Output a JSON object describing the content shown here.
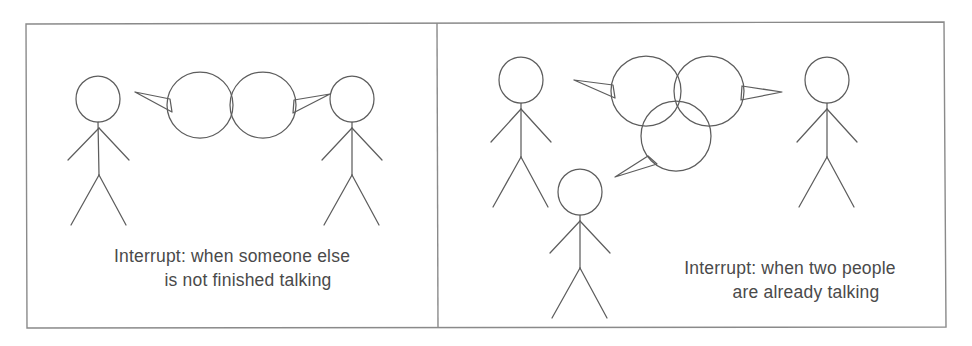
{
  "figure": {
    "type": "line-drawing",
    "medium": "scanned hand-drawn illustration",
    "panel_count": 2,
    "background_color": "#ffffff",
    "ink_color": "#5a5a5a",
    "caption_color": "#4a4a4a"
  },
  "frame": {
    "outer_border": {
      "x": 25,
      "y": 22,
      "width": 921,
      "height": 306
    },
    "divider_x": 437
  },
  "panels": [
    {
      "id": "panel-left",
      "name": "interrupt-one-speaker",
      "caption": {
        "line1": "Interrupt: when someone else",
        "line2": "is not finished talking"
      },
      "people": [
        {
          "name": "speaker-left",
          "head_cx": 98,
          "head_cy": 99,
          "head_r": 22,
          "facing": "right"
        },
        {
          "name": "speaker-right",
          "head_cx": 352,
          "head_cy": 99,
          "head_r": 22,
          "facing": "left"
        }
      ],
      "speech_bubbles": [
        {
          "name": "bubble-left",
          "cx": 200,
          "cy": 105,
          "r": 33,
          "tail": "left"
        },
        {
          "name": "bubble-right",
          "cx": 263,
          "cy": 105,
          "r": 33,
          "tail": "right"
        }
      ]
    },
    {
      "id": "panel-right",
      "name": "interrupt-two-speakers",
      "caption": {
        "line1": "Interrupt: when two people",
        "line2": "are already talking"
      },
      "people": [
        {
          "name": "speaker-upper-left",
          "head_cx": 521,
          "head_cy": 80,
          "head_r": 22,
          "facing": "right"
        },
        {
          "name": "speaker-lower-center",
          "head_cx": 580,
          "head_cy": 192,
          "head_r": 22,
          "facing": "right"
        },
        {
          "name": "speaker-right",
          "head_cx": 827,
          "head_cy": 80,
          "head_r": 22,
          "facing": "left"
        }
      ],
      "speech_bubbles": [
        {
          "name": "bubble-top-left",
          "cx": 646,
          "cy": 91,
          "r": 35,
          "tail": "left"
        },
        {
          "name": "bubble-top-right",
          "cx": 709,
          "cy": 91,
          "r": 35,
          "tail": "right"
        },
        {
          "name": "bubble-bottom-center",
          "cx": 676,
          "cy": 136,
          "r": 35,
          "tail": "lower-left"
        }
      ]
    }
  ],
  "captions": {
    "left": {
      "line1": "Interrupt: when someone else",
      "line2": "is not finished talking",
      "line1_x": 232,
      "line1_y": 262,
      "line2_x": 248,
      "line2_y": 286
    },
    "right": {
      "line1": "Interrupt: when two people",
      "line2": "are already talking",
      "line1_x": 790,
      "line1_y": 274,
      "line2_x": 806,
      "line2_y": 298
    }
  }
}
